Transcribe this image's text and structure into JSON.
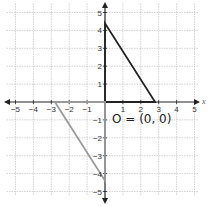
{
  "diagram": {
    "type": "coordinate-plane",
    "x_range": [
      -5,
      5
    ],
    "y_range": [
      -5,
      5
    ],
    "x_axis_label": "x",
    "x_tick_labels": [
      "-5",
      "-4",
      "-3",
      "-2",
      "-1",
      "1",
      "2",
      "3",
      "4",
      "5"
    ],
    "y_tick_labels": [
      "5",
      "4",
      "3",
      "2",
      "1",
      "-1",
      "-2",
      "-3",
      "-4",
      "-5"
    ],
    "origin_label": "O = (0, 0)",
    "shapes": [
      {
        "name": "original-triangle",
        "color": "#222222",
        "vertices": [
          [
            0,
            0
          ],
          [
            0,
            4.4
          ],
          [
            2.8,
            0
          ]
        ]
      },
      {
        "name": "rotated-triangle",
        "color": "#999999",
        "vertices": [
          [
            0,
            0
          ],
          [
            0,
            -4.4
          ],
          [
            -2.8,
            0
          ]
        ]
      }
    ],
    "colors": {
      "grid": "#c8c8c8",
      "axis": "#222222",
      "original": "#222222",
      "image": "#999999"
    }
  }
}
